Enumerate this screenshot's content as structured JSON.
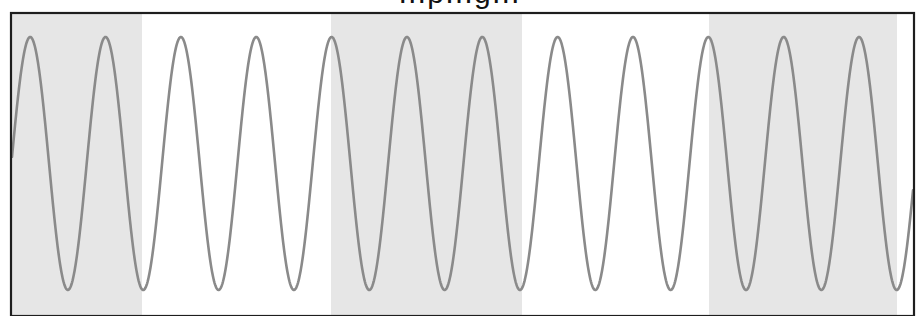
{
  "chart_data": {
    "type": "line",
    "title": "…p…g…",
    "title_visible_fragment": "descenders of 'p' and 'g' only (title cut off at top of image)",
    "xlabel": "",
    "ylabel": "",
    "grid": false,
    "legend": null,
    "axes_ticks_visible": false,
    "series": [
      {
        "name": "sine wave",
        "color": "#8a8a8a",
        "function": "sin",
        "num_visible_peaks": 12,
        "num_visible_troughs": 12,
        "amplitude": 1,
        "peak_x_pixels": [
          30,
          105,
          181,
          256,
          331,
          407,
          487,
          561,
          636,
          711,
          786,
          860
        ],
        "trough_x_pixels": [
          67,
          143,
          218,
          294,
          370,
          445,
          521,
          596,
          672,
          747,
          822,
          897
        ]
      }
    ],
    "shaded_regions": [
      {
        "x_start_px": 12,
        "x_end_px": 142,
        "color": "#e6e6e6"
      },
      {
        "x_start_px": 331,
        "x_end_px": 522,
        "color": "#e6e6e6"
      },
      {
        "x_start_px": 709,
        "x_end_px": 897,
        "color": "#e6e6e6"
      }
    ]
  },
  "layout": {
    "frame": {
      "left": 11,
      "top": 13,
      "right": 914,
      "bottom": 316,
      "color": "#1e1e1e"
    },
    "wave": {
      "x0": 12,
      "x1": 913,
      "first_peak_x": 30.2,
      "period_px": 75.35,
      "mid_y": 163.5,
      "amp_y": 126.5,
      "stroke_width": 2.6
    },
    "colors": {
      "curve": "#8a8a8a",
      "band": "#e6e6e6",
      "background": "#ffffff",
      "frame": "#1e1e1e"
    }
  }
}
